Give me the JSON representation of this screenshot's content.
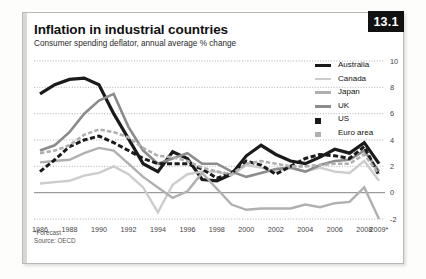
{
  "figure": {
    "badge": "13.1",
    "title": "Inflation in industrial countries",
    "subtitle": "Consumer spending deflator, annual average % change",
    "footnote": "*Forecast",
    "source": "Source: OECD"
  },
  "colors": {
    "australia": "#1a1a1a",
    "canada": "#cccccc",
    "japan": "#b0b0b0",
    "uk": "#8c8c8c",
    "us": "#1a1a1a",
    "euro_area": "#b0b0b0",
    "badge_bg": "#111111",
    "grid": "#9a9a9a",
    "zero_line": "#777777",
    "frame": "#b9b9b4"
  },
  "legend": [
    {
      "label": "Australia",
      "color": "#1a1a1a",
      "style": "solid",
      "width": 3.2
    },
    {
      "label": "Canada",
      "color": "#cccccc",
      "style": "solid",
      "width": 2.4
    },
    {
      "label": "Japan",
      "color": "#b0b0b0",
      "style": "solid",
      "width": 2.4
    },
    {
      "label": "UK",
      "color": "#8c8c8c",
      "style": "solid",
      "width": 2.6
    },
    {
      "label": "US",
      "color": "#1a1a1a",
      "style": "dashed",
      "width": 3.0
    },
    {
      "label": "Euro area",
      "color": "#b0b0b0",
      "style": "dashed",
      "width": 2.6
    }
  ],
  "chart_data": {
    "type": "line",
    "title": "Inflation in industrial countries",
    "subtitle": "Consumer spending deflator, annual average % change",
    "xlabel": "",
    "ylabel": "",
    "ylim": [
      -2,
      10
    ],
    "yticks": [
      10,
      8,
      6,
      4,
      2,
      0,
      -2
    ],
    "xlim": [
      1986,
      2009
    ],
    "xticks": [
      1986,
      1988,
      1990,
      1992,
      1994,
      1996,
      1998,
      2000,
      2002,
      2004,
      2006,
      2008
    ],
    "xtick_labels": [
      "1986",
      "1988",
      "1990",
      "1992",
      "1994",
      "1996",
      "1998",
      "2000",
      "2002",
      "2004",
      "2006",
      "2008",
      "2009*"
    ],
    "grid": true,
    "grid_style": "dotted-horizontal",
    "zero_line": true,
    "legend_position": "right",
    "x": [
      1986,
      1987,
      1988,
      1989,
      1990,
      1991,
      1992,
      1993,
      1994,
      1995,
      1996,
      1997,
      1998,
      1999,
      2000,
      2001,
      2002,
      2003,
      2004,
      2005,
      2006,
      2007,
      2008,
      2009
    ],
    "series": [
      {
        "name": "Australia",
        "color": "#1a1a1a",
        "style": "solid",
        "values": [
          7.5,
          8.2,
          8.6,
          8.7,
          8.2,
          6.0,
          4.1,
          2.2,
          1.6,
          3.1,
          2.6,
          1.0,
          0.9,
          1.4,
          2.8,
          3.6,
          2.9,
          2.4,
          2.2,
          2.7,
          3.3,
          3.0,
          3.8,
          2.2
        ]
      },
      {
        "name": "Canada",
        "color": "#cccccc",
        "style": "solid",
        "values": [
          0.7,
          0.8,
          0.9,
          1.3,
          1.5,
          2.0,
          1.4,
          0.4,
          -1.5,
          0.6,
          1.4,
          1.6,
          1.6,
          1.3,
          2.1,
          1.9,
          1.6,
          1.9,
          1.6,
          1.9,
          1.6,
          1.5,
          2.4,
          0.9
        ]
      },
      {
        "name": "Japan",
        "color": "#b0b0b0",
        "style": "solid",
        "values": [
          2.3,
          2.4,
          2.5,
          3.0,
          3.4,
          3.2,
          2.2,
          1.2,
          0.4,
          -0.4,
          0.1,
          1.5,
          0.3,
          -0.9,
          -1.3,
          -1.2,
          -1.2,
          -1.2,
          -0.9,
          -1.1,
          -0.8,
          -0.7,
          0.4,
          -2.0
        ]
      },
      {
        "name": "UK",
        "color": "#8c8c8c",
        "style": "solid",
        "values": [
          3.2,
          3.6,
          4.6,
          6.0,
          7.0,
          7.5,
          5.0,
          3.2,
          2.2,
          2.6,
          3.0,
          2.2,
          2.2,
          1.6,
          1.2,
          1.5,
          1.8,
          1.9,
          1.6,
          2.1,
          2.4,
          2.5,
          3.2,
          1.6
        ]
      },
      {
        "name": "US",
        "color": "#1a1a1a",
        "style": "dashed",
        "values": [
          1.6,
          2.5,
          3.5,
          4.0,
          4.3,
          3.8,
          3.2,
          2.6,
          2.2,
          2.2,
          2.2,
          1.8,
          1.1,
          1.5,
          2.4,
          2.1,
          1.4,
          2.0,
          2.6,
          2.9,
          2.8,
          2.6,
          3.5,
          1.3
        ]
      },
      {
        "name": "Euro area",
        "color": "#b0b0b0",
        "style": "dashed",
        "values": [
          3.0,
          3.2,
          3.6,
          4.4,
          4.8,
          4.6,
          4.2,
          3.4,
          2.8,
          2.7,
          2.4,
          1.9,
          1.6,
          1.4,
          2.2,
          2.4,
          2.2,
          2.0,
          2.0,
          2.1,
          2.2,
          2.2,
          2.9,
          1.4
        ]
      }
    ]
  }
}
